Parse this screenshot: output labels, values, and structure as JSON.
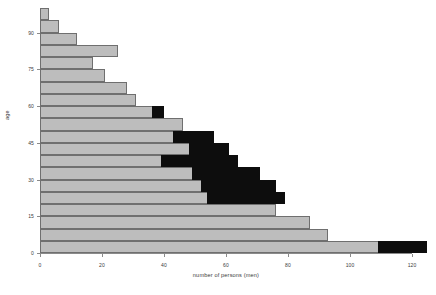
{
  "chart_data": {
    "type": "bar",
    "orientation": "horizontal",
    "stacked": true,
    "title": "",
    "xlabel": "number of persons (men)",
    "ylabel": "age",
    "xlim": [
      0,
      120
    ],
    "ylim": [
      0,
      100
    ],
    "xticks": [
      0,
      20,
      40,
      60,
      80,
      100,
      120
    ],
    "yticks": [
      0,
      15,
      30,
      45,
      60,
      75,
      90
    ],
    "grid": false,
    "legend": "none",
    "bin_width": 5,
    "categories": [
      0,
      5,
      10,
      15,
      20,
      25,
      30,
      35,
      40,
      45,
      50,
      55,
      60,
      65,
      70,
      75,
      80,
      85,
      90,
      95
    ],
    "series": [
      {
        "name": "light",
        "color": "#bdbdbd",
        "values": [
          109,
          93,
          87,
          76,
          54,
          52,
          49,
          39,
          48,
          43,
          46,
          36,
          31,
          28,
          21,
          17,
          25,
          12,
          6,
          3
        ]
      },
      {
        "name": "dark",
        "color": "#0d0d0d",
        "values": [
          16,
          0,
          0,
          0,
          25,
          24,
          22,
          25,
          13,
          13,
          0,
          4,
          0,
          0,
          0,
          0,
          0,
          0,
          0,
          0
        ]
      }
    ],
    "totals": [
      125,
      93,
      87,
      76,
      79,
      76,
      71,
      64,
      61,
      56,
      46,
      40,
      31,
      28,
      21,
      17,
      25,
      12,
      6,
      3
    ]
  },
  "axis": {
    "x_title": "number of persons (men)",
    "y_title": "age",
    "x_tick_labels": [
      "0",
      "20",
      "40",
      "60",
      "80",
      "100",
      "120"
    ],
    "y_tick_labels": [
      "0",
      "15",
      "30",
      "45",
      "60",
      "75",
      "90"
    ]
  }
}
